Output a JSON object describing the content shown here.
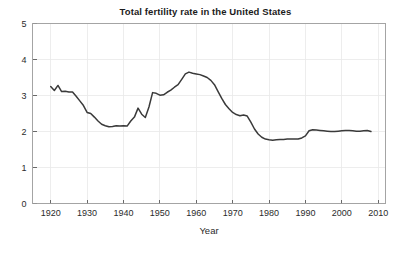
{
  "chart_data": {
    "type": "line",
    "title": "Total fertility rate in the United States",
    "xlabel": "Year",
    "ylabel": "",
    "xlim": [
      1915,
      2012
    ],
    "ylim": [
      0,
      5
    ],
    "grid": true,
    "legend": null,
    "line_color": "#3a3a3a",
    "xticks": [
      1920,
      1930,
      1940,
      1950,
      1960,
      1970,
      1980,
      1990,
      2000,
      2010
    ],
    "xtick_labels": [
      "1920",
      "1930",
      "1940",
      "1950",
      "1960",
      "1970",
      "1980",
      "1990",
      "2000",
      "2010"
    ],
    "yticks": [
      0,
      1,
      2,
      3,
      4,
      5
    ],
    "ytick_labels": [
      "0",
      "1",
      "2",
      "3",
      "4",
      "5"
    ],
    "series": [
      {
        "name": "Total fertility rate",
        "x": [
          1920,
          1921,
          1922,
          1923,
          1924,
          1925,
          1926,
          1927,
          1928,
          1929,
          1930,
          1931,
          1932,
          1933,
          1934,
          1935,
          1936,
          1937,
          1938,
          1939,
          1940,
          1941,
          1942,
          1943,
          1944,
          1945,
          1946,
          1947,
          1948,
          1949,
          1950,
          1951,
          1952,
          1953,
          1954,
          1955,
          1956,
          1957,
          1958,
          1959,
          1960,
          1961,
          1962,
          1963,
          1964,
          1965,
          1966,
          1967,
          1968,
          1969,
          1970,
          1971,
          1972,
          1973,
          1974,
          1975,
          1976,
          1977,
          1978,
          1979,
          1980,
          1981,
          1982,
          1983,
          1984,
          1985,
          1986,
          1987,
          1988,
          1989,
          1990,
          1991,
          1992,
          1993,
          1994,
          1995,
          1996,
          1997,
          1998,
          1999,
          2000,
          2001,
          2002,
          2003,
          2004,
          2005,
          2006,
          2007,
          2008
        ],
        "values": [
          3.25,
          3.14,
          3.28,
          3.11,
          3.12,
          3.1,
          3.1,
          2.98,
          2.85,
          2.72,
          2.53,
          2.5,
          2.4,
          2.29,
          2.2,
          2.16,
          2.13,
          2.14,
          2.16,
          2.15,
          2.16,
          2.15,
          2.29,
          2.4,
          2.65,
          2.48,
          2.39,
          2.68,
          3.08,
          3.06,
          3.01,
          3.02,
          3.09,
          3.15,
          3.23,
          3.3,
          3.45,
          3.6,
          3.65,
          3.62,
          3.6,
          3.58,
          3.54,
          3.5,
          3.42,
          3.3,
          3.11,
          2.92,
          2.75,
          2.63,
          2.53,
          2.47,
          2.44,
          2.46,
          2.43,
          2.26,
          2.07,
          1.93,
          1.84,
          1.79,
          1.77,
          1.76,
          1.77,
          1.78,
          1.78,
          1.79,
          1.79,
          1.79,
          1.79,
          1.82,
          1.88,
          2.02,
          2.05,
          2.04,
          2.03,
          2.02,
          2.01,
          2.0,
          2.0,
          2.01,
          2.02,
          2.03,
          2.03,
          2.02,
          2.01,
          2.01,
          2.02,
          2.03,
          2.0
        ]
      }
    ]
  },
  "figure": {
    "title": "Total fertility rate in the United States",
    "xaxis_title": "Year"
  }
}
